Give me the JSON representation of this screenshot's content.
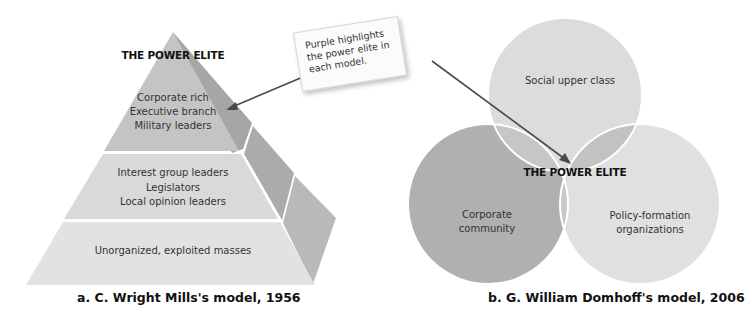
{
  "callout": {
    "text": "Purple highlights the power elite in each model."
  },
  "pyramid": {
    "title": "THE POWER ELITE",
    "tiers": [
      {
        "lines": [
          "Corporate rich",
          "Executive branch",
          "Military leaders"
        ],
        "is_power_elite": true
      },
      {
        "lines": [
          "Interest group leaders",
          "Legislators",
          "Local opinion leaders"
        ],
        "is_power_elite": false
      },
      {
        "lines": [
          "Unorganized, exploited masses"
        ],
        "is_power_elite": false
      }
    ],
    "caption": "a. C. Wright Mills's model, 1956"
  },
  "venn": {
    "circles": [
      {
        "label": "Social upper class"
      },
      {
        "label": "Corporate community"
      },
      {
        "label": "Policy-formation organizations"
      }
    ],
    "center_label": "THE POWER ELITE",
    "caption": "b. G. William Domhoff's model, 2006"
  },
  "colors": {
    "tier_top": "#c4c4c4",
    "tier_mid": "#d9d9d9",
    "tier_bottom": "#e2e2e2",
    "side_top": "#a6a6a6",
    "side_mid": "#ababab",
    "side_bottom": "#b9b9b9",
    "circle_social": "#dcdcdc",
    "circle_corporate": "#b0b0b0",
    "circle_policy": "#e0e0e0",
    "overlap_pair": "#c6c6c6",
    "overlap_center": "#999999",
    "arrow": "#4a4a4a"
  }
}
